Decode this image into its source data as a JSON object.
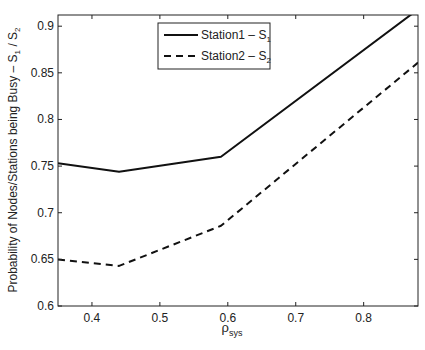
{
  "chart_data": {
    "type": "line",
    "title": "",
    "xlabel": "ρ_sys",
    "xlabel_main": "ρ",
    "xlabel_sub": "sys",
    "ylabel": "Probability of Nodes/Stations being Busy – S1 / S2",
    "ylabel_parts": [
      "Probability of Nodes/Stations being Busy – S",
      "1",
      " / S",
      "2"
    ],
    "xlim": [
      0.35,
      0.88
    ],
    "ylim": [
      0.6,
      0.912
    ],
    "xticks": [
      0.4,
      0.5,
      0.6,
      0.7,
      0.8
    ],
    "xtick_labels": [
      "0.4",
      "0.5",
      "0.6",
      "0.7",
      "0.8"
    ],
    "yticks": [
      0.6,
      0.65,
      0.7,
      0.75,
      0.8,
      0.85,
      0.9
    ],
    "ytick_labels": [
      "0.6",
      "0.65",
      "0.7",
      "0.75",
      "0.8",
      "0.85",
      "0.9"
    ],
    "grid": false,
    "legend_position": "upper center",
    "x": [
      0.35,
      0.44,
      0.59,
      0.88
    ],
    "series": [
      {
        "name": "Station1 – S1",
        "label_main": "Station1 – S",
        "label_sub": "1",
        "style": "solid",
        "color": "#111111",
        "values": [
          0.753,
          0.744,
          0.76,
          0.918
        ]
      },
      {
        "name": "Station2 – S2",
        "label_main": "Station2 – S",
        "label_sub": "2",
        "style": "dashed",
        "color": "#111111",
        "values": [
          0.65,
          0.643,
          0.686,
          0.861
        ]
      }
    ]
  }
}
